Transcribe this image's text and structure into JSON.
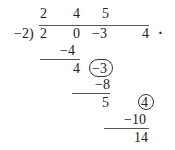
{
  "division": {
    "divisor": "−2)",
    "quotient": [
      "2",
      "4",
      "5"
    ],
    "dividend": [
      "2",
      "0",
      "−3",
      "4"
    ],
    "trailing_mark": "·",
    "steps": [
      {
        "subtract": "−4",
        "result": "4",
        "next_term_circled": "−3"
      },
      {
        "subtract": "−8",
        "result": "5",
        "next_term_circled": "4"
      },
      {
        "subtract": "−10",
        "result": "14"
      }
    ]
  }
}
